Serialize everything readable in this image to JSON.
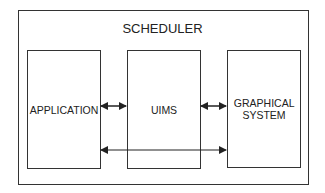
{
  "diagram": {
    "container_label": "SCHEDULER",
    "nodes": [
      {
        "id": "application",
        "label": "APPLICATION"
      },
      {
        "id": "uims",
        "label": "UIMS"
      },
      {
        "id": "graphical_system",
        "label": "GRAPHICAL SYSTEM"
      }
    ],
    "edges": [
      {
        "from": "application",
        "to": "uims",
        "type": "bidirectional"
      },
      {
        "from": "uims",
        "to": "graphical_system",
        "type": "bidirectional"
      },
      {
        "from": "application",
        "to": "graphical_system",
        "type": "bidirectional"
      }
    ]
  }
}
